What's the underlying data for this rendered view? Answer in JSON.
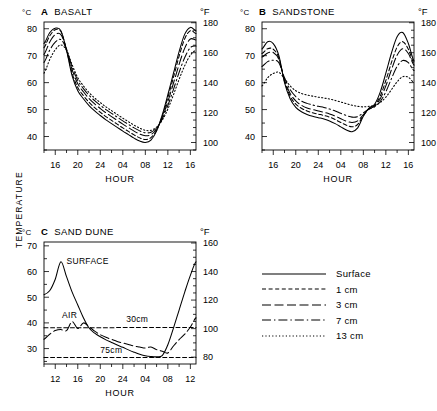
{
  "figure": {
    "y_axis_label": "TEMPERATURE",
    "unit_celsius": "°C",
    "unit_fahrenheit": "°F",
    "x_axis_label": "HOUR"
  },
  "legend": {
    "position": "bottom-right",
    "entries": [
      {
        "label": "Surface",
        "style": "solid",
        "dash": "none"
      },
      {
        "label": "1 cm",
        "style": "dashed",
        "dash": "4,2.6"
      },
      {
        "label": "3 cm",
        "style": "long-dash",
        "dash": "9,3.5"
      },
      {
        "label": "7 cm",
        "style": "dash-dot",
        "dash": "9,3,1.4,3"
      },
      {
        "label": "13 cm",
        "style": "dotted",
        "dash": "1.2,2.2"
      }
    ]
  },
  "chart_data": [
    {
      "type": "line",
      "panel": "A",
      "title": "BASALT",
      "title_full": "°C  A  BASALT",
      "xlabel": "HOUR",
      "ylabel": "TEMPERATURE",
      "ylabel_left_unit": "°C",
      "ylabel_right_unit": "°F",
      "xlim": [
        14,
        17
      ],
      "xtick_labels": [
        "16",
        "20",
        "24",
        "04",
        "08",
        "12",
        "16"
      ],
      "xtick_values": [
        16,
        20,
        24,
        28,
        32,
        36,
        40
      ],
      "x_minor_step": 2,
      "ylim": [
        35.0,
        82.5
      ],
      "ytick_labels": [
        "40",
        "50",
        "60",
        "70",
        "80"
      ],
      "ytick_values": [
        40,
        50,
        60,
        70,
        80
      ],
      "y2_labels": [
        "100",
        "120",
        "140",
        "160",
        "180"
      ],
      "y2_values": [
        100,
        120,
        140,
        160,
        180
      ],
      "y2_minor_step": 5,
      "grid": false,
      "x": [
        14,
        15,
        16,
        17,
        18,
        19,
        20,
        21,
        22,
        23,
        24,
        25,
        26,
        27,
        28,
        29,
        30,
        31,
        32,
        33,
        34,
        35,
        36,
        37,
        38,
        39,
        40,
        41
      ],
      "series": [
        {
          "name": "Surface",
          "style": "solid",
          "values": [
            74.5,
            78.5,
            80.2,
            79.3,
            72.0,
            62.5,
            57.0,
            54.0,
            51.5,
            49.5,
            47.8,
            46.2,
            44.8,
            43.4,
            42.0,
            40.7,
            39.4,
            38.3,
            37.8,
            38.7,
            42.0,
            48.0,
            55.5,
            63.5,
            71.5,
            78.0,
            80.5,
            79.2
          ]
        },
        {
          "name": "1 cm",
          "style": "dashed",
          "values": [
            73.0,
            77.3,
            79.6,
            79.0,
            72.2,
            63.5,
            58.2,
            55.2,
            52.7,
            50.7,
            49.0,
            47.4,
            46.0,
            44.6,
            43.2,
            41.9,
            40.6,
            39.5,
            38.9,
            39.6,
            42.3,
            47.5,
            54.5,
            62.0,
            69.8,
            76.3,
            79.3,
            78.2
          ]
        },
        {
          "name": "3 cm",
          "style": "long-dash",
          "values": [
            70.5,
            75.0,
            77.8,
            77.8,
            72.4,
            64.8,
            59.6,
            56.6,
            54.1,
            52.1,
            50.4,
            48.8,
            47.4,
            46.0,
            44.6,
            43.3,
            42.0,
            40.9,
            40.3,
            40.7,
            42.8,
            47.0,
            53.0,
            59.8,
            66.8,
            72.8,
            76.2,
            75.8
          ]
        },
        {
          "name": "7 cm",
          "style": "dash-dot",
          "values": [
            67.5,
            72.0,
            75.0,
            76.0,
            72.3,
            65.8,
            60.8,
            57.8,
            55.3,
            53.3,
            51.6,
            50.0,
            48.6,
            47.2,
            45.8,
            44.5,
            43.2,
            42.1,
            41.4,
            41.6,
            43.2,
            46.5,
            51.5,
            57.5,
            63.8,
            69.3,
            73.0,
            73.6
          ]
        },
        {
          "name": "13 cm",
          "style": "dotted",
          "values": [
            63.5,
            68.5,
            72.2,
            74.0,
            72.0,
            66.6,
            61.8,
            58.8,
            56.3,
            54.3,
            52.6,
            51.0,
            49.6,
            48.2,
            46.8,
            45.5,
            44.2,
            43.1,
            42.3,
            42.3,
            43.5,
            46.0,
            50.2,
            55.5,
            61.2,
            66.3,
            70.2,
            72.0
          ]
        }
      ]
    },
    {
      "type": "line",
      "panel": "B",
      "title": "SANDSTONE",
      "title_full": "°C  B  SANDSTONE",
      "xlabel": "HOUR",
      "ylabel": "TEMPERATURE",
      "ylabel_left_unit": "°C",
      "ylabel_right_unit": "°F",
      "xlim": [
        14,
        17
      ],
      "xtick_labels": [
        "16",
        "20",
        "24",
        "04",
        "08",
        "12",
        "16"
      ],
      "xtick_values": [
        16,
        20,
        24,
        28,
        32,
        36,
        40
      ],
      "x_minor_step": 2,
      "ylim": [
        35.0,
        82.5
      ],
      "ytick_labels": [
        "40",
        "50",
        "60",
        "70",
        "80"
      ],
      "ytick_values": [
        40,
        50,
        60,
        70,
        80
      ],
      "y2_labels": [
        "100",
        "120",
        "140",
        "160",
        "180"
      ],
      "y2_values": [
        100,
        120,
        140,
        160,
        180
      ],
      "y2_minor_step": 5,
      "grid": false,
      "x": [
        14,
        15,
        16,
        17,
        18,
        19,
        20,
        21,
        22,
        23,
        24,
        25,
        26,
        27,
        28,
        29,
        30,
        31,
        32,
        33,
        34,
        35,
        36,
        37,
        38,
        39,
        40,
        41
      ],
      "series": [
        {
          "name": "Surface",
          "style": "solid",
          "values": [
            72.5,
            75.2,
            74.5,
            70.0,
            60.0,
            54.0,
            50.8,
            49.2,
            48.2,
            47.5,
            47.0,
            46.5,
            45.8,
            44.8,
            43.6,
            42.4,
            41.8,
            43.2,
            47.5,
            50.5,
            52.0,
            56.5,
            63.5,
            71.0,
            77.0,
            78.6,
            74.5,
            68.0
          ]
        },
        {
          "name": "1 cm",
          "style": "dashed",
          "values": [
            70.8,
            72.6,
            72.4,
            69.2,
            60.5,
            55.0,
            52.0,
            50.5,
            49.5,
            48.8,
            48.3,
            47.8,
            47.2,
            46.3,
            45.2,
            44.2,
            43.6,
            44.5,
            47.8,
            50.3,
            51.6,
            55.0,
            60.8,
            67.5,
            73.2,
            75.2,
            72.4,
            67.2
          ]
        },
        {
          "name": "3 cm",
          "style": "long-dash",
          "values": [
            69.5,
            71.0,
            71.2,
            68.6,
            61.0,
            56.0,
            53.2,
            51.6,
            50.6,
            50.0,
            49.5,
            49.0,
            48.4,
            47.6,
            46.6,
            45.7,
            45.2,
            45.8,
            48.1,
            50.2,
            51.3,
            54.0,
            58.8,
            64.8,
            70.2,
            72.6,
            70.8,
            66.5
          ]
        },
        {
          "name": "7 cm",
          "style": "dash-dot",
          "values": [
            66.0,
            67.8,
            68.3,
            67.4,
            61.8,
            57.4,
            54.8,
            53.2,
            52.3,
            51.7,
            51.2,
            50.8,
            50.2,
            49.5,
            48.6,
            47.8,
            47.2,
            47.4,
            48.8,
            50.2,
            51.0,
            53.0,
            56.6,
            61.5,
            66.0,
            68.2,
            67.4,
            64.5
          ]
        },
        {
          "name": "13 cm",
          "style": "dotted",
          "values": [
            58.8,
            61.8,
            63.4,
            63.8,
            61.5,
            58.8,
            57.0,
            56.0,
            55.4,
            55.0,
            54.6,
            54.3,
            53.9,
            53.4,
            52.8,
            52.2,
            51.6,
            51.2,
            51.0,
            51.2,
            51.5,
            52.6,
            54.6,
            57.4,
            60.3,
            62.2,
            62.0,
            60.0
          ]
        }
      ]
    },
    {
      "type": "line",
      "panel": "C",
      "title": "SAND DUNE",
      "title_full": "°C  C  SAND DUNE",
      "xlabel": "HOUR",
      "ylabel": "TEMPERATURE",
      "ylabel_left_unit": "°C",
      "ylabel_right_unit": "°F",
      "xlim": [
        10,
        13.5
      ],
      "xtick_labels": [
        "12",
        "16",
        "20",
        "24",
        "04",
        "08",
        "12"
      ],
      "xtick_values": [
        12,
        16,
        20,
        24,
        28,
        32,
        36
      ],
      "x_minor_step": 2,
      "ylim": [
        24.0,
        71.5
      ],
      "ytick_labels": [
        "30",
        "40",
        "50",
        "60",
        "70"
      ],
      "ytick_values": [
        30,
        40,
        50,
        60,
        70
      ],
      "y2_labels": [
        "80",
        "100",
        "120",
        "140",
        "160"
      ],
      "y2_values": [
        80,
        100,
        120,
        140,
        160
      ],
      "y2_minor_step": 5,
      "grid": false,
      "annotations": [
        {
          "text": "SURFACE",
          "x": 14.0,
          "y": 63.0
        },
        {
          "text": "AIR",
          "x": 13.2,
          "y": 41.8
        },
        {
          "text": "30cm",
          "x": 24.6,
          "y": 40.4
        },
        {
          "text": "75cm",
          "x": 20.0,
          "y": 28.3
        }
      ],
      "x": [
        10,
        11,
        12,
        13,
        14,
        15,
        16,
        17,
        18,
        19,
        20,
        21,
        22,
        23,
        24,
        25,
        26,
        27,
        28,
        29,
        30,
        31,
        32,
        33,
        34,
        35,
        36,
        37
      ],
      "series": [
        {
          "name": "Surface",
          "style": "solid",
          "values": [
            51.0,
            52.5,
            57.0,
            63.8,
            58.0,
            52.0,
            47.0,
            42.0,
            38.0,
            36.0,
            34.6,
            33.4,
            32.4,
            31.4,
            30.5,
            29.5,
            28.6,
            27.8,
            27.2,
            26.9,
            26.8,
            27.3,
            31.5,
            38.0,
            45.0,
            52.0,
            58.5,
            63.8
          ]
        },
        {
          "name": "AIR",
          "style": "long-dash",
          "values": [
            33.6,
            35.6,
            37.0,
            37.4,
            37.0,
            40.5,
            37.8,
            40.0,
            38.5,
            36.8,
            35.4,
            34.4,
            33.6,
            32.8,
            32.2,
            31.6,
            31.0,
            30.6,
            30.2,
            30.6,
            29.6,
            29.0,
            28.3,
            31.0,
            33.5,
            35.6,
            38.4,
            42.0
          ]
        },
        {
          "name": "30cm",
          "style": "dashed",
          "values": [
            38.1,
            38.1,
            38.1,
            38.1,
            38.1,
            38.1,
            38.1,
            38.1,
            38.1,
            38.1,
            38.1,
            38.1,
            38.1,
            38.2,
            38.2,
            38.2,
            38.2,
            38.2,
            38.2,
            38.2,
            38.2,
            38.2,
            38.2,
            38.2,
            38.2,
            38.2,
            38.2,
            38.2
          ]
        },
        {
          "name": "75cm",
          "style": "dashed",
          "values": [
            26.5,
            26.5,
            26.5,
            26.5,
            26.5,
            26.5,
            26.5,
            26.5,
            26.5,
            26.5,
            26.5,
            26.5,
            26.5,
            26.5,
            26.5,
            26.5,
            26.5,
            26.5,
            26.5,
            26.5,
            26.5,
            26.5,
            26.5,
            26.5,
            26.5,
            26.5,
            26.5,
            26.5
          ]
        }
      ]
    }
  ]
}
